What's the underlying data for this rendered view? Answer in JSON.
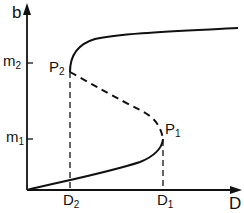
{
  "axes": {
    "y_label": "b",
    "x_label": "D"
  },
  "ticks": {
    "y": [
      {
        "id": "m2",
        "base": "m",
        "sub": "2"
      },
      {
        "id": "m1",
        "base": "m",
        "sub": "1"
      }
    ],
    "x": [
      {
        "id": "D2",
        "base": "D",
        "sub": "2"
      },
      {
        "id": "D1",
        "base": "D",
        "sub": "1"
      }
    ]
  },
  "points": [
    {
      "id": "P2",
      "base": "P",
      "sub": "2"
    },
    {
      "id": "P1",
      "base": "P",
      "sub": "1"
    }
  ],
  "curve": {
    "stable_branches_style": "solid",
    "unstable_branch_style": "dashed",
    "color": "#111111"
  }
}
